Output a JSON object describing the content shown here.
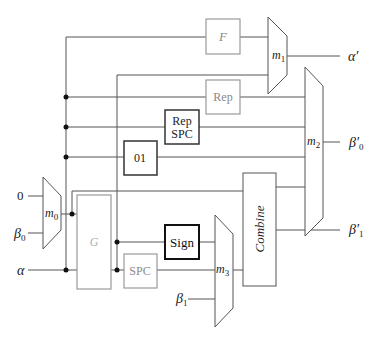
{
  "colors": {
    "wire": "#555555",
    "gray_box": "#9a9a9a",
    "black_box": "#222222",
    "text_dark": "#222222",
    "text_gray": "#8a8a8a",
    "background": "#ffffff"
  },
  "inputs": {
    "zero": "0",
    "beta0": "β",
    "beta0_sub": "0",
    "alpha": "α",
    "beta1": "β",
    "beta1_sub": "1"
  },
  "outputs": {
    "alpha_prime": "α′",
    "beta0_prime": "β′",
    "beta0_prime_sub": "0",
    "beta1_prime": "β′",
    "beta1_prime_sub": "1"
  },
  "blocks": {
    "F": "F",
    "G": "G",
    "Rep": "Rep",
    "RepSPC_line1": "Rep",
    "RepSPC_line2": "SPC",
    "zero_one": "01",
    "Sign": "Sign",
    "SPC": "SPC",
    "Combine": "Combine"
  },
  "muxes": {
    "m0": "m",
    "m0_sub": "0",
    "m1": "m",
    "m1_sub": "1",
    "m2": "m",
    "m2_sub": "2",
    "m3": "m",
    "m3_sub": "3"
  }
}
